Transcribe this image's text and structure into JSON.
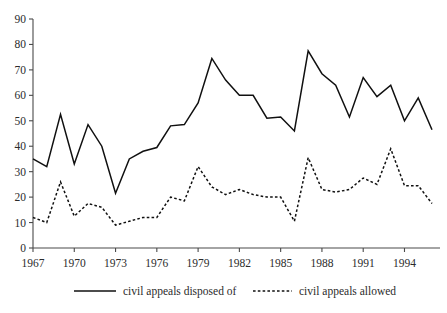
{
  "chart_data": {
    "type": "line",
    "title": "",
    "subtitle": "",
    "xlabel": "",
    "ylabel": "",
    "xlim": [
      1967,
      1996
    ],
    "ylim": [
      0,
      90
    ],
    "grid": false,
    "legend_position": "bottom",
    "x": [
      1967,
      1968,
      1969,
      1970,
      1971,
      1972,
      1973,
      1974,
      1975,
      1976,
      1977,
      1978,
      1979,
      1980,
      1981,
      1982,
      1983,
      1984,
      1985,
      1986,
      1987,
      1988,
      1989,
      1990,
      1991,
      1992,
      1993,
      1994,
      1995,
      1996
    ],
    "xticks": [
      1967,
      1970,
      1973,
      1976,
      1979,
      1982,
      1985,
      1988,
      1991,
      1994
    ],
    "xticklabels": [
      "1967",
      "1970",
      "1973",
      "1976",
      "1979",
      "1982",
      "1985",
      "1988",
      "1991",
      "1994"
    ],
    "yticks": [
      0,
      10,
      20,
      30,
      40,
      50,
      60,
      70,
      80,
      90
    ],
    "yticklabels": [
      "0",
      "10",
      "20",
      "30",
      "40",
      "50",
      "60",
      "70",
      "80",
      "90"
    ],
    "series": [
      {
        "name": "civil appeals disposed of",
        "style": "solid",
        "color": "#101010",
        "values": [
          35,
          32,
          52.5,
          33,
          48.5,
          40,
          21.5,
          35,
          38,
          39.5,
          48,
          48.5,
          57,
          74.5,
          66,
          60,
          60,
          51,
          51.5,
          46,
          77.5,
          68.5,
          64,
          51.5,
          67,
          59.5,
          64,
          50,
          59,
          46.5
        ]
      },
      {
        "name": "civil appeals allowed",
        "style": "dotted",
        "color": "#101010",
        "values": [
          12,
          10,
          26,
          12.5,
          17.5,
          16,
          9,
          10.5,
          12,
          12,
          20,
          18.5,
          32,
          24,
          21,
          23,
          21,
          20,
          20,
          10.5,
          35.5,
          23,
          22,
          23,
          27.5,
          25,
          39,
          24.5,
          24.5,
          17.5
        ]
      }
    ]
  },
  "legend": {
    "items": [
      {
        "label": "civil appeals disposed of",
        "style": "solid"
      },
      {
        "label": "civil appeals allowed",
        "style": "dotted"
      }
    ]
  }
}
